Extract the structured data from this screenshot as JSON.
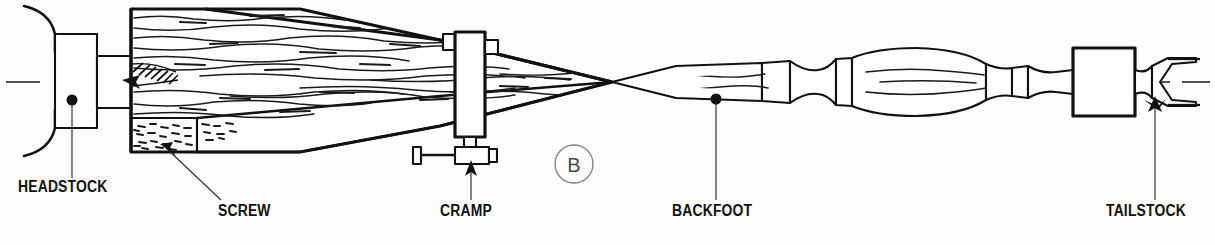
{
  "figure": {
    "marker": "B",
    "background_color": "#fdfdfc",
    "ink_color": "#111111",
    "marker_color": "#8a8a8a"
  },
  "labels": [
    {
      "id": "headstock",
      "text": "HEADSTOCK",
      "x": 18,
      "y": 188,
      "leader_from": [
        72,
        181
      ],
      "leader_to": [
        72,
        100
      ]
    },
    {
      "id": "screw",
      "text": "SCREW",
      "x": 222,
      "y": 212,
      "leader_from": [
        218,
        203
      ],
      "leader_to": [
        160,
        150
      ]
    },
    {
      "id": "cramp",
      "text": "CRAMP",
      "x": 440,
      "y": 212,
      "leader_from": [
        471,
        203
      ],
      "leader_to": [
        471,
        158
      ]
    },
    {
      "id": "backfoot",
      "text": "BACKFOOT",
      "x": 672,
      "y": 212,
      "leader_from": [
        716,
        203
      ],
      "leader_to": [
        716,
        100
      ]
    },
    {
      "id": "tailstock",
      "text": "TAILSTOCK",
      "x": 1110,
      "y": 212,
      "leader_from": [
        1155,
        203
      ],
      "leader_to": [
        1155,
        105
      ]
    }
  ],
  "dots": [
    {
      "id": "headstock-dot",
      "cx": 72,
      "cy": 100,
      "r": 5.5
    },
    {
      "id": "backfoot-dot",
      "cx": 716,
      "cy": 99,
      "r": 5.5
    }
  ],
  "arrows": [
    {
      "id": "screw-arrow",
      "tip": [
        160,
        150
      ]
    },
    {
      "id": "cramp-arrow",
      "tip": [
        471,
        158
      ]
    },
    {
      "id": "tailstock-arrow",
      "tip": [
        1155,
        105
      ]
    }
  ],
  "parts": {
    "headstock_label": "HEADSTOCK",
    "screw_label": "SCREW",
    "cramp_label": "CRAMP",
    "backfoot_label": "BACKFOOT",
    "tailstock_label": "TAILSTOCK"
  },
  "geometry": {
    "centerline_y": 82,
    "billet_left": 131,
    "billet_right": 170,
    "billet_top": 9,
    "billet_bottom": 152,
    "cramp_x": 455,
    "cramp_width": 30,
    "taper_point_x": 612,
    "tailstock_block_left": 1073,
    "tailstock_block_right": 1135,
    "spindle_right_end": 1190
  }
}
